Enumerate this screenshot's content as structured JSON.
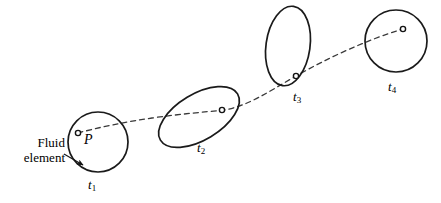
{
  "figure": {
    "type": "schematic-diagram",
    "width": 441,
    "height": 203,
    "background_color": "#ffffff",
    "line_color": "#1a1a1a",
    "dash_color": "#3a3a3a"
  },
  "callout": {
    "line1": "Fluid",
    "line2": "element",
    "arrow": {
      "from_x": 64,
      "from_y": 154,
      "to_x": 83,
      "to_y": 165
    }
  },
  "point_label": {
    "text": "P",
    "x": 84,
    "y": 132
  },
  "elements": [
    {
      "name": "fluid-element-t1",
      "label": "t",
      "subscript": "1",
      "shape": "circle",
      "cx": 98,
      "cy": 142,
      "rx": 30,
      "ry": 30,
      "rotation": 0,
      "label_x": 88,
      "label_y": 178,
      "marker_x": 78,
      "marker_y": 133
    },
    {
      "name": "fluid-element-t2",
      "label": "t",
      "subscript": "2",
      "shape": "ellipse",
      "cx": 199,
      "cy": 117,
      "rx": 45,
      "ry": 23,
      "rotation": -31,
      "label_x": 197,
      "label_y": 141,
      "marker_x": 222,
      "marker_y": 110
    },
    {
      "name": "fluid-element-t3",
      "label": "t",
      "subscript": "3",
      "shape": "ellipse",
      "cx": 288,
      "cy": 46,
      "rx": 22,
      "ry": 40,
      "rotation": 8,
      "label_x": 293,
      "label_y": 90,
      "marker_x": 296,
      "marker_y": 76
    },
    {
      "name": "fluid-element-t4",
      "label": "t",
      "subscript": "4",
      "shape": "circle",
      "cx": 396,
      "cy": 41,
      "rx": 31,
      "ry": 31,
      "rotation": 0,
      "label_x": 388,
      "label_y": 80,
      "marker_x": 403,
      "marker_y": 29
    }
  ],
  "pathline": {
    "name": "particle-pathline",
    "style": "dashed",
    "dash_pattern": "5 4",
    "d": "M 78 133 C 100 127 125 122 152 118 C 180 114 205 112 224 110 C 248 106 268 92 296 76 C 326 59 366 40 403 29"
  }
}
